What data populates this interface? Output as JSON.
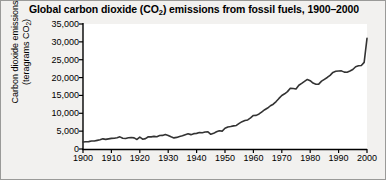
{
  "figure": {
    "title_prefix": "Global carbon dioxide (CO",
    "title_sub": "2",
    "title_suffix": ") emissions from fossil fuels, 1900–2000",
    "title_full": "Global carbon dioxide (CO2) emissions from fossil fuels, 1900–2000",
    "background_color": "#f2f1ef",
    "plot_background_color": "#ffffff",
    "border_color": "#9a9a98",
    "line_color": "#333333",
    "axis_color": "#000000"
  },
  "axes": {
    "ylabel_line1": "Carbon dioxide emissions",
    "ylabel_line2_prefix": "(teragrams CO",
    "ylabel_line2_sub": "2",
    "ylabel_line2_suffix": ")",
    "ylabel_full": "Carbon dioxide emissions (teragrams CO2)",
    "xlabel": "",
    "ytick_labels": [
      "0",
      "5,000",
      "10,000",
      "15,000",
      "20,000",
      "25,000",
      "30,000",
      "35,000"
    ],
    "xtick_labels": [
      "1900",
      "1910",
      "1920",
      "1930",
      "1940",
      "1950",
      "1960",
      "1970",
      "1980",
      "1990",
      "2000"
    ]
  },
  "chart_data": {
    "type": "line",
    "title": "Global carbon dioxide (CO2) emissions from fossil fuels, 1900–2000",
    "xlabel": "",
    "ylabel": "Carbon dioxide emissions (teragrams CO2)",
    "xlim": [
      1900,
      2000
    ],
    "ylim": [
      0,
      35000
    ],
    "ytick_values": [
      0,
      5000,
      10000,
      15000,
      20000,
      25000,
      30000,
      35000
    ],
    "xtick_values": [
      1900,
      1910,
      1920,
      1930,
      1940,
      1950,
      1960,
      1970,
      1980,
      1990,
      2000
    ],
    "grid": false,
    "legend": false,
    "units": "teragrams CO2",
    "series": [
      {
        "name": "Global CO2 emissions from fossil fuels",
        "x": [
          1900,
          1901,
          1902,
          1903,
          1904,
          1905,
          1906,
          1907,
          1908,
          1909,
          1910,
          1911,
          1912,
          1913,
          1914,
          1915,
          1916,
          1917,
          1918,
          1919,
          1920,
          1921,
          1922,
          1923,
          1924,
          1925,
          1926,
          1927,
          1928,
          1929,
          1930,
          1931,
          1932,
          1933,
          1934,
          1935,
          1936,
          1937,
          1938,
          1939,
          1940,
          1941,
          1942,
          1943,
          1944,
          1945,
          1946,
          1947,
          1948,
          1949,
          1950,
          1951,
          1952,
          1953,
          1954,
          1955,
          1956,
          1957,
          1958,
          1959,
          1960,
          1961,
          1962,
          1963,
          1964,
          1965,
          1966,
          1967,
          1968,
          1969,
          1970,
          1971,
          1972,
          1973,
          1974,
          1975,
          1976,
          1977,
          1978,
          1979,
          1980,
          1981,
          1982,
          1983,
          1984,
          1985,
          1986,
          1987,
          1988,
          1989,
          1990,
          1991,
          1992,
          1993,
          1994,
          1995,
          1996,
          1997,
          1998,
          1999,
          2000
        ],
        "values": [
          1960,
          2020,
          2070,
          2240,
          2240,
          2410,
          2570,
          2840,
          2690,
          2840,
          2980,
          3010,
          3150,
          3400,
          3000,
          2930,
          3160,
          3220,
          3110,
          2680,
          3350,
          2740,
          2900,
          3420,
          3400,
          3530,
          3440,
          3780,
          3810,
          4070,
          3800,
          3410,
          3110,
          3250,
          3520,
          3700,
          4010,
          4260,
          4020,
          4300,
          4380,
          4600,
          4560,
          4750,
          4810,
          4120,
          4380,
          4820,
          5120,
          5000,
          5800,
          6180,
          6290,
          6480,
          6600,
          7180,
          7660,
          7980,
          8140,
          8700,
          9390,
          9420,
          9820,
          10400,
          11000,
          11470,
          12110,
          12550,
          13290,
          14160,
          14980,
          15460,
          16070,
          17010,
          16920,
          16820,
          17860,
          18370,
          18930,
          19470,
          19120,
          18460,
          18150,
          18170,
          18990,
          19510,
          20030,
          20630,
          21440,
          21750,
          21850,
          21880,
          21530,
          21500,
          21820,
          22250,
          23030,
          23300,
          23370,
          24260,
          31000
        ]
      }
    ]
  }
}
